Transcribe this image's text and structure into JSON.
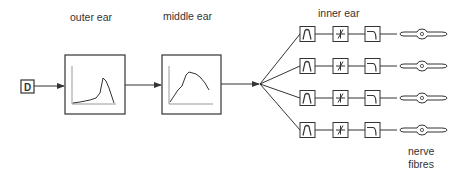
{
  "labels": {
    "outer_ear": "outer ear",
    "middle_ear": "middle ear",
    "inner_ear": "inner ear",
    "nerve_line1": "nerve",
    "nerve_line2": "fibres"
  },
  "source": {
    "glyph": "D"
  },
  "channels": 4,
  "colors": {
    "stroke": "#333333",
    "text": "#333333"
  }
}
